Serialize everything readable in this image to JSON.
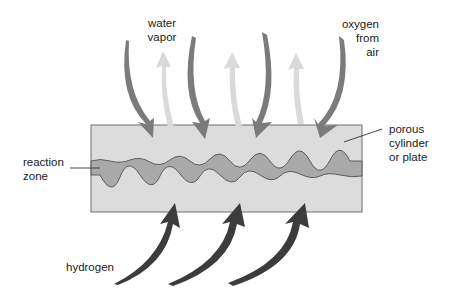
{
  "diagram": {
    "type": "fuel-cell-schematic",
    "labels": {
      "water_vapor": [
        "water",
        "vapor"
      ],
      "oxygen": [
        "oxygen",
        "from",
        "air"
      ],
      "porous": [
        "porous",
        "cylinder",
        "or plate"
      ],
      "reaction_zone": [
        "reaction",
        "zone"
      ],
      "hydrogen": "hydrogen"
    },
    "colors": {
      "plate_fill": "#dcdcdc",
      "plate_border": "#6f6f6f",
      "reaction_zone_fill": "#a9a9a9",
      "oxygen_arrow": "#7b7b7b",
      "water_vapor_arrow": "#dadada",
      "hydrogen_arrow": "#3c3c3c"
    },
    "arrows": {
      "oxygen_in": 4,
      "water_vapor_out": 3,
      "hydrogen_in": 3
    }
  }
}
